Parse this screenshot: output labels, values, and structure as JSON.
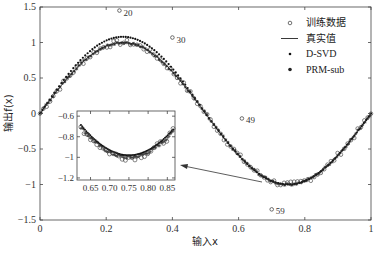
{
  "chart_data": {
    "type": "scatter",
    "title": "",
    "xlabel": "输入x",
    "ylabel": "输出f(x)",
    "xlim": [
      0,
      1
    ],
    "ylim": [
      -1.5,
      1.5
    ],
    "xticks": [
      "0",
      "0.2",
      "0.4",
      "0.6",
      "0.8",
      "1"
    ],
    "yticks": [
      "1.5",
      "1",
      "0.5",
      "0",
      "-0.5",
      "-1",
      "-1.5"
    ],
    "grid": false,
    "legend_position": "upper right",
    "legend": [
      {
        "label": "训练数据",
        "marker": "open-circle"
      },
      {
        "label": "真实值",
        "marker": "line"
      },
      {
        "label": "D-SVD",
        "marker": "small-dot"
      },
      {
        "label": "PRM-sub",
        "marker": "star"
      }
    ],
    "true_function": "sin(2*pi*x)",
    "series": [
      {
        "name": "真实值",
        "kind": "line",
        "x": [
          0,
          0.05,
          0.1,
          0.15,
          0.2,
          0.25,
          0.3,
          0.35,
          0.4,
          0.45,
          0.5,
          0.55,
          0.6,
          0.65,
          0.7,
          0.75,
          0.8,
          0.85,
          0.9,
          0.95,
          1.0
        ],
        "y": [
          0,
          0.31,
          0.59,
          0.81,
          0.95,
          1.0,
          0.95,
          0.81,
          0.59,
          0.31,
          0,
          -0.31,
          -0.59,
          -0.81,
          -0.95,
          -1.0,
          -0.95,
          -0.81,
          -0.59,
          -0.31,
          0
        ]
      },
      {
        "name": "D-SVD",
        "kind": "scatter",
        "x": [
          0,
          0.05,
          0.1,
          0.15,
          0.2,
          0.25,
          0.3,
          0.35,
          0.4,
          0.45,
          0.5,
          0.55,
          0.6,
          0.65,
          0.7,
          0.75,
          0.8,
          0.85,
          0.9,
          0.95,
          1.0
        ],
        "y": [
          0,
          0.33,
          0.63,
          0.87,
          1.03,
          1.08,
          1.03,
          0.87,
          0.63,
          0.33,
          0,
          -0.31,
          -0.59,
          -0.81,
          -0.95,
          -1.0,
          -0.95,
          -0.81,
          -0.59,
          -0.31,
          0
        ]
      },
      {
        "name": "PRM-sub",
        "kind": "scatter",
        "x": [
          0,
          0.05,
          0.1,
          0.15,
          0.2,
          0.25,
          0.3,
          0.35,
          0.4,
          0.45,
          0.5,
          0.55,
          0.6,
          0.65,
          0.7,
          0.75,
          0.8,
          0.85,
          0.9,
          0.95,
          1.0
        ],
        "y": [
          0,
          0.31,
          0.59,
          0.81,
          0.95,
          1.0,
          0.95,
          0.81,
          0.59,
          0.31,
          0,
          -0.31,
          -0.59,
          -0.81,
          -0.95,
          -1.0,
          -0.95,
          -0.81,
          -0.59,
          -0.31,
          0
        ]
      }
    ],
    "outliers": [
      {
        "label": "20",
        "x": 0.24,
        "y": 1.45
      },
      {
        "label": "30",
        "x": 0.4,
        "y": 1.07
      },
      {
        "label": "49",
        "x": 0.61,
        "y": -0.07
      },
      {
        "label": "59",
        "x": 0.7,
        "y": -1.35
      }
    ],
    "inset": {
      "xlim": [
        0.62,
        0.87
      ],
      "ylim": [
        -1.22,
        -0.55
      ],
      "xticks": [
        "0.65",
        "0.70",
        "0.75",
        "0.80",
        "0.85"
      ],
      "yticks": [
        "-0.6",
        "-0.8",
        "-1",
        "-1.2"
      ]
    }
  }
}
